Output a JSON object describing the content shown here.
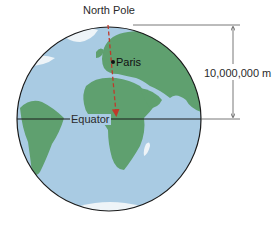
{
  "diagram": {
    "labels": {
      "north_pole": "North Pole",
      "paris": "Paris",
      "equator": "Equator",
      "distance": "10,000,000 m"
    },
    "colors": {
      "ocean": "#a9cbe3",
      "land": "#5fa06f",
      "ice": "#eef4f8",
      "meridian_arrow": "#c0392b",
      "outline": "#1a1a1a",
      "dimension_line": "#555555"
    }
  }
}
